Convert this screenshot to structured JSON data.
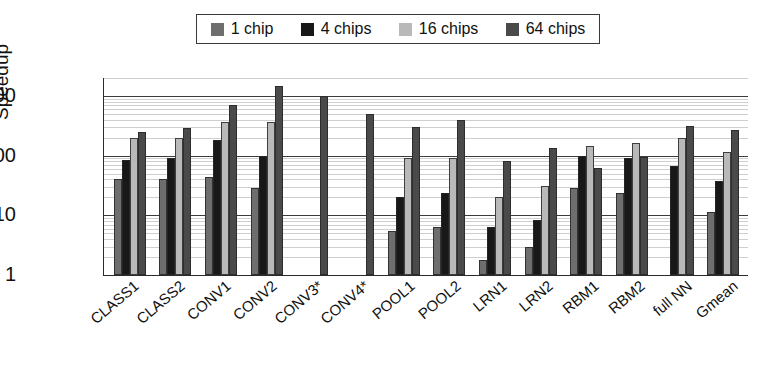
{
  "chart": {
    "type": "bar",
    "title": "",
    "ylabel": "Speedup",
    "xlabel": ""
  },
  "legend": {
    "position": "top-center",
    "items": [
      {
        "label": "1 chip",
        "color": "#6e6e6e",
        "icon": "legend-swatch"
      },
      {
        "label": "4 chips",
        "color": "#181818",
        "icon": "legend-swatch"
      },
      {
        "label": "16 chips",
        "color": "#b9b9b9",
        "icon": "legend-swatch"
      },
      {
        "label": "64 chips",
        "color": "#4a4a4a",
        "icon": "legend-swatch"
      }
    ]
  },
  "yaxis": {
    "scale": "log",
    "ticks": [
      "1000",
      "100",
      "10",
      "1"
    ],
    "min": 1,
    "max": 2000,
    "minor_grid": true
  },
  "chart_data": {
    "type": "bar",
    "title": "",
    "xlabel": "",
    "ylabel": "Speedup",
    "yscale": "log",
    "ylim": [
      1,
      2000
    ],
    "yticks": [
      1,
      10,
      100,
      1000
    ],
    "grid": true,
    "legend_position": "top-center",
    "categories": [
      "CLASS1",
      "CLASS2",
      "CONV1",
      "CONV2",
      "CONV3*",
      "CONV4*",
      "POOL1",
      "POOL2",
      "LRN1",
      "LRN2",
      "RBM1",
      "RBM2",
      "full NN",
      "Gmean"
    ],
    "series": [
      {
        "name": "1 chip",
        "color": "#6e6e6e",
        "values": [
          40,
          41,
          44,
          29,
          null,
          null,
          5.5,
          6.5,
          1.8,
          2.9,
          29,
          24,
          null,
          11.5
        ]
      },
      {
        "name": "4 chips",
        "color": "#181818",
        "values": [
          85,
          93,
          180,
          100,
          null,
          null,
          20,
          24,
          6.5,
          8.5,
          97,
          90,
          68,
          38
        ]
      },
      {
        "name": "16 chips",
        "color": "#b9b9b9",
        "values": [
          195,
          200,
          370,
          370,
          null,
          null,
          90,
          90,
          20,
          31,
          145,
          160,
          200,
          115
        ]
      },
      {
        "name": "64 chips",
        "color": "#4a4a4a",
        "values": [
          250,
          290,
          700,
          1450,
          1000,
          490,
          300,
          390,
          82,
          135,
          62,
          95,
          310,
          265
        ]
      }
    ]
  }
}
